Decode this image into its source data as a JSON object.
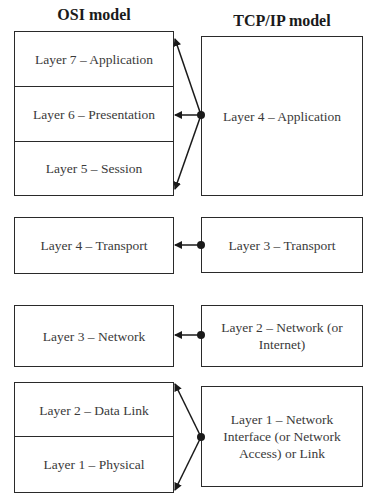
{
  "titles": {
    "osi": "OSI model",
    "tcpip": "TCP/IP model"
  },
  "osi_layers": [
    {
      "label": "Layer 7 – Application"
    },
    {
      "label": "Layer 6 – Presentation"
    },
    {
      "label": "Layer 5 – Session"
    },
    {
      "label": "Layer 4 – Transport"
    },
    {
      "label": "Layer 3 – Network"
    },
    {
      "label": "Layer 2 – Data Link"
    },
    {
      "label": "Layer 1 – Physical"
    }
  ],
  "tcpip_layers": [
    {
      "label": "Layer 4 – Application",
      "maps_to": [
        "Layer 7",
        "Layer 6",
        "Layer 5"
      ]
    },
    {
      "label": "Layer 3 – Transport",
      "maps_to": [
        "Layer 4"
      ]
    },
    {
      "label": "Layer 2 – Network (or Internet)",
      "maps_to": [
        "Layer 3"
      ]
    },
    {
      "label": "Layer 1 – Network Interface (or Network Access) or Link",
      "maps_to": [
        "Layer 2",
        "Layer 1"
      ]
    }
  ],
  "colors": {
    "line": "#1a1a1a",
    "text": "#3a3a3a",
    "background": "#ffffff"
  }
}
